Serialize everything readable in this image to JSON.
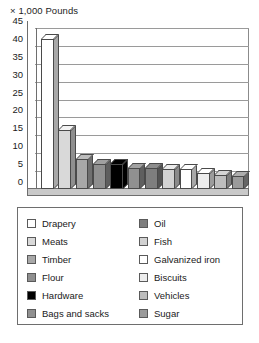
{
  "chart_data": {
    "type": "bar",
    "title": "× 1,000 Pounds",
    "xlabel": "",
    "ylabel": "",
    "ylim": [
      0,
      45
    ],
    "ytick_step": 5,
    "yticks": [
      "45",
      "40",
      "35",
      "30",
      "25",
      "20",
      "15",
      "10",
      "5",
      "0"
    ],
    "grid": true,
    "legend_position": "below-chart",
    "style": "3d-bars",
    "categories": [
      "Drapery",
      "Meats",
      "Timber",
      "Flour",
      "Hardware",
      "Bags and sacks",
      "Oil",
      "Fish",
      "Galvanized iron",
      "Biscuits",
      "Vehicles",
      "Sugar"
    ],
    "values": [
      42,
      16.5,
      8.5,
      7,
      7,
      6,
      6,
      5.5,
      5.5,
      4.5,
      4,
      3.5
    ],
    "colors": [
      "#ffffff",
      "#d9d9d9",
      "#a8a8a8",
      "#8f8f8f",
      "#000000",
      "#909090",
      "#7e7e7e",
      "#d2d2d2",
      "#ffffff",
      "#ededed",
      "#bdbdbd",
      "#9b9b9b"
    ]
  },
  "legend": {
    "column_left": [
      {
        "label": "Drapery",
        "color": "#ffffff"
      },
      {
        "label": "Meats",
        "color": "#d9d9d9"
      },
      {
        "label": "Timber",
        "color": "#a8a8a8"
      },
      {
        "label": "Flour",
        "color": "#8f8f8f"
      },
      {
        "label": "Hardware",
        "color": "#000000"
      },
      {
        "label": "Bags and sacks",
        "color": "#909090"
      }
    ],
    "column_right": [
      {
        "label": "Oil",
        "color": "#7e7e7e"
      },
      {
        "label": "Fish",
        "color": "#d2d2d2"
      },
      {
        "label": "Galvanized iron",
        "color": "#ffffff"
      },
      {
        "label": "Biscuits",
        "color": "#ededed"
      },
      {
        "label": "Vehicles",
        "color": "#bdbdbd"
      },
      {
        "label": "Sugar",
        "color": "#9b9b9b"
      }
    ]
  },
  "caption": ""
}
